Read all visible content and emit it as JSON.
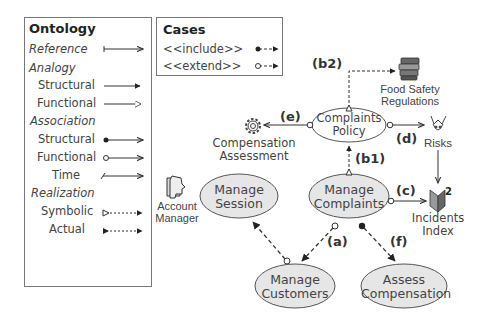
{
  "ontology_legend": {
    "title": "Ontology",
    "items": [
      {
        "label": "Reference",
        "style": "category",
        "arrow": "open-thin"
      },
      {
        "label": "Analogy",
        "style": "category"
      },
      {
        "label": "Structural",
        "style": "sub",
        "arrow": "filled-triangle"
      },
      {
        "label": "Functional",
        "style": "sub",
        "arrow": "hollow-triangle"
      },
      {
        "label": "Association",
        "style": "category"
      },
      {
        "label": "Structural",
        "style": "sub",
        "arrow": "filled-dot-open"
      },
      {
        "label": "Functional",
        "style": "sub",
        "arrow": "hollow-dot-open"
      },
      {
        "label": "Time",
        "style": "sub",
        "arrow": "slash-open"
      },
      {
        "label": "Realization",
        "style": "category"
      },
      {
        "label": "Symbolic",
        "style": "sub",
        "arrow": "dashed-hollow-tail"
      },
      {
        "label": "Actual",
        "style": "sub",
        "arrow": "dashed-filled-tail"
      }
    ]
  },
  "cases_legend": {
    "title": "Cases",
    "items": [
      {
        "label": "<<include>>",
        "arrow": "filled-dot-dashed"
      },
      {
        "label": "<<extend>>",
        "arrow": "hollow-dot-dashed"
      }
    ]
  },
  "use_cases": {
    "complaints_policy": {
      "line1": "Complaints",
      "line2": "Policy"
    },
    "manage_session": {
      "line1": "Manage",
      "line2": "Session"
    },
    "manage_complaints": {
      "line1": "Manage",
      "line2": "Complaints"
    },
    "manage_customers": {
      "line1": "Manage",
      "line2": "Customers"
    },
    "assess_compensation": {
      "line1": "Assess",
      "line2": "Compensation"
    }
  },
  "external_entities": {
    "food_safety": {
      "line1": "Food Safety",
      "line2": "Regulations",
      "icon": "books-icon"
    },
    "compensation_assessment": {
      "line1": "Compensation",
      "line2": "Assessment",
      "icon": "gear-icon"
    },
    "risks": {
      "line1": "Risks",
      "icon": "risk-icon"
    },
    "incidents_index": {
      "line1": "Incidents",
      "line2": "Index",
      "icon": "index-book-icon"
    },
    "account_manager": {
      "line1": "Account",
      "line2": "Manager",
      "icon": "actor-head-icon"
    }
  },
  "edge_labels": {
    "a": "(a)",
    "b1": "(b1)",
    "b2": "(b2)",
    "c": "(c)",
    "d": "(d)",
    "e": "(e)",
    "f": "(f)"
  },
  "colors": {
    "ellipse_fill": "#e6e6e6",
    "ellipse_stroke": "#555555",
    "line": "#333333",
    "legend_border": "#777777"
  }
}
